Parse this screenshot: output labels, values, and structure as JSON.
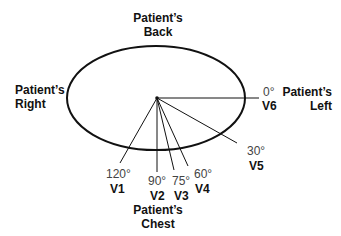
{
  "diagram": {
    "orientations": {
      "back": {
        "line1": "Patient’s",
        "line2": "Back"
      },
      "right": {
        "line1": "Patient’s",
        "line2": "Right"
      },
      "left": {
        "line1": "Patient’s",
        "line2": "Left"
      },
      "chest": {
        "line1": "Patient’s",
        "line2": "Chest"
      }
    },
    "leads": [
      {
        "name": "V1",
        "angle": "120°",
        "angle_value": 120
      },
      {
        "name": "V2",
        "angle": "90°",
        "angle_value": 90
      },
      {
        "name": "V3",
        "angle": "75°",
        "angle_value": 75
      },
      {
        "name": "V4",
        "angle": "60°",
        "angle_value": 60
      },
      {
        "name": "V5",
        "angle": "30°",
        "angle_value": 30
      },
      {
        "name": "V6",
        "angle": "0°",
        "angle_value": 0
      }
    ],
    "colors": {
      "line": "#111111",
      "angle_text": "#444444",
      "label_text": "#111111"
    }
  }
}
